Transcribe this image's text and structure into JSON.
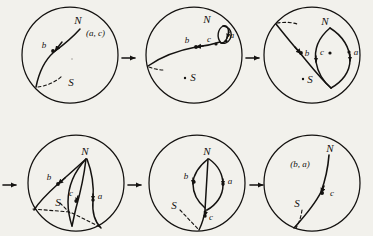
{
  "figure": {
    "background_color": "#f2f1ec",
    "ink_color": "#141210",
    "panel_count": 6,
    "rows": 2,
    "columns": 3,
    "arrow_glyph": "→",
    "panels": [
      {
        "id": "panel-1",
        "index": 1,
        "row": 1,
        "column": 1,
        "cx": 70,
        "cy": 55,
        "r": 48,
        "labels": [
          {
            "name": "label-N",
            "text": "N",
            "x": 78,
            "y": 24,
            "size": "cap"
          },
          {
            "name": "label-pair-ac",
            "text": "(a, c)",
            "x": 86,
            "y": 36,
            "size": "pair"
          },
          {
            "name": "label-b",
            "text": "b",
            "x": 44,
            "y": 48,
            "size": "low"
          },
          {
            "name": "label-S",
            "text": "S",
            "x": 71,
            "y": 86,
            "size": "cap"
          }
        ],
        "points": [
          {
            "name": "point-b",
            "x": 53,
            "y": 51
          }
        ],
        "dot_marks": [
          {
            "name": "dot-center-mark",
            "x": 72,
            "y": 59
          }
        ]
      },
      {
        "id": "panel-2",
        "index": 2,
        "row": 1,
        "column": 2,
        "cx": 194,
        "cy": 55,
        "r": 48,
        "labels": [
          {
            "name": "label-N",
            "text": "N",
            "x": 207,
            "y": 23,
            "size": "cap"
          },
          {
            "name": "label-b",
            "text": "b",
            "x": 187,
            "y": 43,
            "size": "low"
          },
          {
            "name": "label-c",
            "text": "c",
            "x": 209,
            "y": 42,
            "size": "low"
          },
          {
            "name": "label-a",
            "text": "a",
            "x": 230,
            "y": 38,
            "size": "low"
          },
          {
            "name": "label-S",
            "text": "S",
            "x": 193,
            "y": 81,
            "size": "cap"
          }
        ],
        "points": [
          {
            "name": "point-b",
            "x": 196,
            "y": 47
          },
          {
            "name": "point-c",
            "x": 216,
            "y": 44
          },
          {
            "name": "point-a",
            "x": 226,
            "y": 41
          }
        ],
        "dot_marks": [
          {
            "name": "dot-S-mark",
            "x": 185,
            "y": 78
          }
        ]
      },
      {
        "id": "panel-3",
        "index": 3,
        "row": 1,
        "column": 3,
        "cx": 312,
        "cy": 55,
        "r": 48,
        "labels": [
          {
            "name": "label-N",
            "text": "N",
            "x": 325,
            "y": 25,
            "size": "cap"
          },
          {
            "name": "label-b",
            "text": "b",
            "x": 306,
            "y": 55,
            "size": "low"
          },
          {
            "name": "label-c",
            "text": "c",
            "x": 322,
            "y": 54,
            "size": "low"
          },
          {
            "name": "label-a",
            "text": "a",
            "x": 355,
            "y": 55,
            "size": "low"
          },
          {
            "name": "label-S",
            "text": "S",
            "x": 310,
            "y": 82,
            "size": "cap"
          }
        ],
        "points": [
          {
            "name": "point-b",
            "x": 301,
            "y": 53
          },
          {
            "name": "point-c",
            "x": 330,
            "y": 53
          },
          {
            "name": "point-a",
            "x": 349,
            "y": 52
          }
        ],
        "dot_marks": [
          {
            "name": "dot-S-mark",
            "x": 303,
            "y": 79
          }
        ]
      },
      {
        "id": "panel-4",
        "index": 4,
        "row": 2,
        "column": 1,
        "cx": 76,
        "cy": 183,
        "r": 48,
        "labels": [
          {
            "name": "label-N",
            "text": "N",
            "x": 85,
            "y": 155,
            "size": "cap"
          },
          {
            "name": "label-b",
            "text": "b",
            "x": 49,
            "y": 179,
            "size": "low"
          },
          {
            "name": "label-c",
            "text": "c",
            "x": 70,
            "y": 196,
            "size": "low"
          },
          {
            "name": "label-a",
            "text": "a",
            "x": 98,
            "y": 198,
            "size": "low"
          },
          {
            "name": "label-S",
            "text": "S",
            "x": 58,
            "y": 206,
            "size": "cap"
          }
        ],
        "points": [
          {
            "name": "point-b",
            "x": 58,
            "y": 184
          },
          {
            "name": "point-c",
            "x": 76,
            "y": 201
          },
          {
            "name": "point-a",
            "x": 93,
            "y": 200
          }
        ],
        "dot_marks": []
      },
      {
        "id": "panel-5",
        "index": 5,
        "row": 2,
        "column": 2,
        "cx": 197,
        "cy": 183,
        "r": 48,
        "labels": [
          {
            "name": "label-N",
            "text": "N",
            "x": 207,
            "y": 155,
            "size": "cap"
          },
          {
            "name": "label-b",
            "text": "b",
            "x": 186,
            "y": 178,
            "size": "low"
          },
          {
            "name": "label-a",
            "text": "a",
            "x": 228,
            "y": 183,
            "size": "low"
          },
          {
            "name": "label-c",
            "text": "c",
            "x": 209,
            "y": 219,
            "size": "low"
          },
          {
            "name": "label-S",
            "text": "S",
            "x": 174,
            "y": 209,
            "size": "cap"
          }
        ],
        "points": [
          {
            "name": "point-b",
            "x": 194,
            "y": 182
          },
          {
            "name": "point-a",
            "x": 223,
            "y": 184
          },
          {
            "name": "point-c",
            "x": 205,
            "y": 216
          }
        ],
        "dot_marks": []
      },
      {
        "id": "panel-6",
        "index": 6,
        "row": 2,
        "column": 3,
        "cx": 312,
        "cy": 183,
        "r": 48,
        "labels": [
          {
            "name": "label-N",
            "text": "N",
            "x": 327,
            "y": 152,
            "size": "cap"
          },
          {
            "name": "label-pair-ba",
            "text": "(b, a)",
            "x": 300,
            "y": 165,
            "size": "pair"
          },
          {
            "name": "label-c",
            "text": "c",
            "x": 330,
            "y": 196,
            "size": "low"
          },
          {
            "name": "label-S",
            "text": "S",
            "x": 297,
            "y": 206,
            "size": "cap"
          }
        ],
        "points": [
          {
            "name": "point-c",
            "x": 322,
            "y": 193
          }
        ],
        "dot_marks": []
      }
    ],
    "arrows": [
      {
        "name": "arrow-1-to-2",
        "x": 122,
        "y": 58
      },
      {
        "name": "arrow-2-to-3",
        "x": 246,
        "y": 58
      },
      {
        "name": "arrow-into-4",
        "x": 4,
        "y": 185
      },
      {
        "name": "arrow-4-to-5",
        "x": 128,
        "y": 185
      },
      {
        "name": "arrow-5-to-6",
        "x": 250,
        "y": 185
      }
    ]
  }
}
